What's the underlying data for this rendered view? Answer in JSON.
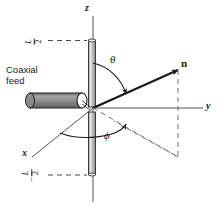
{
  "figure": {
    "background_color": "#ffffff",
    "ink_color": "#1a1a1a"
  },
  "axes": {
    "z_label": "z",
    "y_label": "y",
    "x_label": "x"
  },
  "vectors": {
    "n_label": "n"
  },
  "angles": {
    "theta_label": "θ",
    "phi_label": "ϕ"
  },
  "feed": {
    "line1": "Coaxial",
    "line2": "feed"
  },
  "dimensions": {
    "upper": {
      "sign": "",
      "numerator": "L",
      "denominator": "2"
    },
    "lower": {
      "sign": "−",
      "numerator": "L",
      "denominator": "2"
    }
  },
  "colors": {
    "ink": "#1a1a1a",
    "axis": "#555555",
    "rod_fill": "#c9c9c9",
    "rod_edge": "#2b2b2b",
    "feed_fill": "#8e8e8e",
    "feed_edge": "#1f1f1f",
    "dash": "#6e6e6e"
  }
}
